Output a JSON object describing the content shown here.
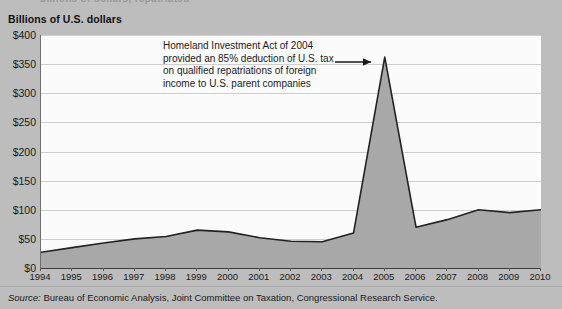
{
  "page": {
    "clipped_top_text": "billions of dollars, repatriated",
    "background_color": "#bdbdbd",
    "plot_background_color": "#fbfbfb",
    "area_fill_color": "#a8a8a8",
    "line_color": "#222222"
  },
  "axis_title": "Billions of U.S. dollars",
  "annotation": {
    "lines": [
      "Homeland Investment Act of 2004",
      "provided an 85% deduction of U.S. tax",
      "on qualified repatriations of foreign",
      "income to U.S. parent companies"
    ],
    "arrow_target_label": "2005"
  },
  "source": {
    "prefix": "Source:",
    "text": " Bureau of Economic Analysis, Joint Committee on Taxation, Congressional Research Service."
  },
  "chart_data": {
    "type": "area",
    "title": "",
    "xlabel": "",
    "ylabel": "Billions of U.S. dollars",
    "ylim": [
      0,
      400
    ],
    "ytick_step": 50,
    "ytick_labels": [
      "$0",
      "$50",
      "$100",
      "$150",
      "$200",
      "$250",
      "$300",
      "$350",
      "$400"
    ],
    "ytick_values": [
      0,
      50,
      100,
      150,
      200,
      250,
      300,
      350,
      400
    ],
    "grid": true,
    "legend": "none",
    "categories": [
      1994,
      1995,
      1996,
      1997,
      1998,
      1999,
      2000,
      2001,
      2002,
      2003,
      2004,
      2005,
      2006,
      2007,
      2008,
      2009,
      2010
    ],
    "xtick_labels": [
      "1994",
      "1995",
      "1996",
      "1997",
      "1998",
      "1999",
      "2000",
      "2001",
      "2002",
      "2003",
      "2004",
      "2005",
      "2006",
      "2007",
      "2008",
      "2009",
      "2010"
    ],
    "series": [
      {
        "name": "Repatriated foreign income",
        "values": [
          27,
          35,
          43,
          50,
          54,
          65,
          62,
          52,
          46,
          45,
          60,
          362,
          70,
          83,
          100,
          95,
          100
        ]
      }
    ],
    "annotations": [
      {
        "text": "Homeland Investment Act of 2004 provided an 85% deduction of U.S. tax on qualified repatriations of foreign income to U.S. parent companies",
        "points_to_x": 2005,
        "points_to_y": 362
      }
    ]
  }
}
